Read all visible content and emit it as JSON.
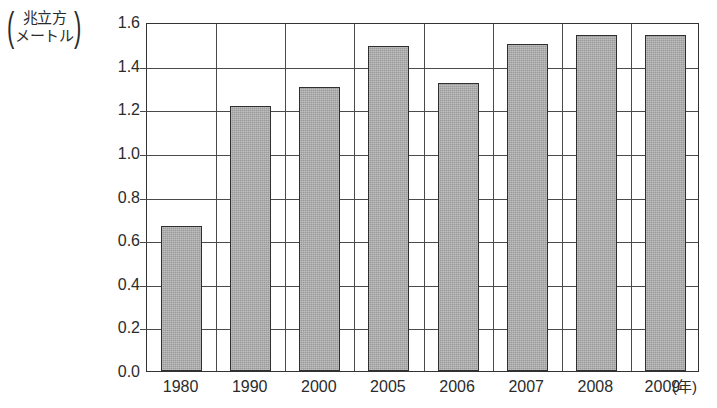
{
  "chart_data": {
    "type": "bar",
    "title": "",
    "subtitle": "",
    "xlabel": "(年)",
    "ylabel": "(兆立方メートル)",
    "ylabel_lines": [
      "兆立方",
      "メートル"
    ],
    "categories": [
      "1980",
      "1990",
      "2000",
      "2005",
      "2006",
      "2007",
      "2008",
      "2009"
    ],
    "values": [
      0.67,
      1.22,
      1.31,
      1.5,
      1.33,
      1.51,
      1.55,
      1.55
    ],
    "series": [
      {
        "name": "",
        "values": [
          0.67,
          1.22,
          1.31,
          1.5,
          1.33,
          1.51,
          1.55,
          1.55
        ]
      }
    ],
    "ylim": [
      0.0,
      1.6
    ],
    "ytick_labels": [
      "0.0",
      "0.2",
      "0.4",
      "0.6",
      "0.8",
      "1.0",
      "1.2",
      "1.4",
      "1.6"
    ],
    "ytick_values": [
      0.0,
      0.2,
      0.4,
      0.6,
      0.8,
      1.0,
      1.2,
      1.4,
      1.6
    ],
    "grid": "horizontal-and-category-verticals",
    "legend": "none",
    "bar_color": "#9a9a9a",
    "bar_border_color": "#2f2f2f",
    "axis_color": "#333333",
    "grid_color": "#4a4a4a",
    "background_color": "#ffffff"
  },
  "axis": {
    "unit_paren_open": "(",
    "unit_paren_close": ")"
  }
}
